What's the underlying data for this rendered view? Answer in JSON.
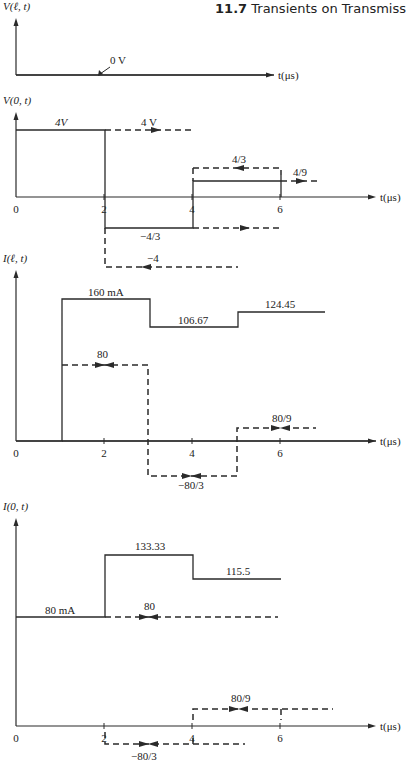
{
  "header": {
    "section_number": "11.7",
    "section_title": "Transients on Transmiss"
  },
  "colors": {
    "ink": "#2a2a2a",
    "background": "#ffffff"
  },
  "chart_data": [
    {
      "id": "v-load",
      "type": "line",
      "title": "",
      "ylabel": "V(ℓ, t)",
      "xlabel": "t(μs)",
      "origin": [
        16,
        75
      ],
      "px_per_us": 44,
      "axis_top": 18,
      "axis_right": 274,
      "ticks": [],
      "solid": [
        [
          [
            16,
            75
          ],
          [
            274,
            75
          ]
        ]
      ],
      "dashed": [],
      "arrows": [],
      "labels": [
        {
          "text": "0 V",
          "x": 110,
          "y": 64
        }
      ],
      "pointer": {
        "from": [
          110,
          67
        ],
        "to": [
          98,
          76
        ]
      }
    },
    {
      "id": "v-source",
      "type": "line",
      "ylabel": "V(0, t)",
      "xlabel": "t(μs)",
      "origin": [
        16,
        197
      ],
      "px_per_us": 44,
      "axis_top": 112,
      "axis_right": 376,
      "ticks": [
        {
          "t": 0,
          "label": "0"
        },
        {
          "t": 2,
          "label": "2"
        },
        {
          "t": 4,
          "label": "4"
        },
        {
          "t": 6,
          "label": "6"
        }
      ],
      "steps": [
        {
          "t_start": 0,
          "t_end": 2,
          "value": "4V"
        },
        {
          "t_start": 2,
          "t_end": 4,
          "value": "-4/3"
        },
        {
          "t_start": 4,
          "t_end": 6,
          "value": "4/9"
        }
      ],
      "solid": [
        [
          [
            16,
            130
          ],
          [
            105,
            130
          ],
          [
            105,
            228
          ],
          [
            193,
            228
          ],
          [
            193,
            181
          ],
          [
            281,
            181
          ]
        ],
        [
          [
            281,
            175
          ],
          [
            281,
            197
          ]
        ]
      ],
      "dashed": [
        [
          [
            105,
            130
          ],
          [
            192,
            130
          ]
        ],
        [
          [
            193,
            168
          ],
          [
            281,
            168
          ],
          [
            281,
            175
          ]
        ],
        [
          [
            193,
            168
          ],
          [
            193,
            181
          ]
        ],
        [
          [
            193,
            228
          ],
          [
            281,
            228
          ]
        ],
        [
          [
            281,
            181
          ],
          [
            318,
            181
          ]
        ],
        [
          [
            105,
            228
          ],
          [
            105,
            267
          ],
          [
            238,
            267
          ]
        ]
      ],
      "arrows": [
        {
          "x": 155,
          "y": 130,
          "dir": "right"
        },
        {
          "x": 240,
          "y": 168,
          "dir": "left"
        },
        {
          "x": 300,
          "y": 181,
          "dir": "right"
        },
        {
          "x": 244,
          "y": 228,
          "dir": "right"
        },
        {
          "x": 147,
          "y": 267,
          "dir": "left"
        }
      ],
      "labels": [
        {
          "text": "4V",
          "x": 55,
          "y": 126,
          "italic": true
        },
        {
          "text": "4 V",
          "x": 141,
          "y": 126
        },
        {
          "text": "4/3",
          "x": 232,
          "y": 163
        },
        {
          "text": "4/9",
          "x": 293,
          "y": 176
        },
        {
          "text": "−4/3",
          "x": 140,
          "y": 240
        },
        {
          "text": "−4",
          "x": 147,
          "y": 262
        }
      ]
    },
    {
      "id": "i-load",
      "type": "line",
      "ylabel": "I(ℓ, t)",
      "xlabel": "t(μs)",
      "origin": [
        16,
        441
      ],
      "px_per_us": 44,
      "axis_top": 270,
      "axis_right": 376,
      "ticks": [
        {
          "t": 0,
          "label": "0"
        },
        {
          "t": 2,
          "label": "2"
        },
        {
          "t": 4,
          "label": "4"
        },
        {
          "t": 6,
          "label": "6"
        }
      ],
      "steps": [
        {
          "t_start": 1,
          "t_end": 3,
          "value": "160 mA"
        },
        {
          "t_start": 3,
          "t_end": 5,
          "value": "106.67"
        },
        {
          "t_start": 5,
          "t_end": 7,
          "value": "124.45"
        }
      ],
      "solid": [
        [
          [
            16,
            441
          ],
          [
            62,
            441
          ],
          [
            62,
            299
          ],
          [
            150,
            299
          ],
          [
            150,
            327
          ],
          [
            238,
            327
          ],
          [
            238,
            312
          ],
          [
            325,
            312
          ]
        ],
        [
          [
            62,
            441
          ],
          [
            376,
            441
          ]
        ]
      ],
      "dashed": [
        [
          [
            62,
            365
          ],
          [
            148,
            365
          ],
          [
            148,
            476
          ],
          [
            237,
            476
          ],
          [
            237,
            428
          ],
          [
            316,
            428
          ]
        ]
      ],
      "arrows": [
        {
          "x": 99,
          "y": 365,
          "dir": "right"
        },
        {
          "x": 110,
          "y": 365,
          "dir": "left"
        },
        {
          "x": 186,
          "y": 476,
          "dir": "right"
        },
        {
          "x": 197,
          "y": 476,
          "dir": "left"
        },
        {
          "x": 275,
          "y": 428,
          "dir": "right"
        },
        {
          "x": 286,
          "y": 428,
          "dir": "left"
        }
      ],
      "labels": [
        {
          "text": "160 mA",
          "x": 88,
          "y": 296
        },
        {
          "text": "106.67",
          "x": 178,
          "y": 324
        },
        {
          "text": "124.45",
          "x": 265,
          "y": 308
        },
        {
          "text": "80",
          "x": 97,
          "y": 358
        },
        {
          "text": "80/9",
          "x": 272,
          "y": 422
        },
        {
          "text": "−80/3",
          "x": 178,
          "y": 489
        }
      ]
    },
    {
      "id": "i-source",
      "type": "line",
      "ylabel": "I(0, t)",
      "xlabel": "t(μs)",
      "origin": [
        16,
        726
      ],
      "px_per_us": 44,
      "axis_top": 518,
      "axis_right": 376,
      "ticks": [
        {
          "t": 0,
          "label": "0"
        },
        {
          "t": 2,
          "label": "2"
        },
        {
          "t": 4,
          "label": "4"
        },
        {
          "t": 6,
          "label": "6"
        }
      ],
      "steps": [
        {
          "t_start": 0,
          "t_end": 2,
          "value": "80 mA"
        },
        {
          "t_start": 2,
          "t_end": 4,
          "value": "133.33"
        },
        {
          "t_start": 4,
          "t_end": 6,
          "value": "115.5"
        }
      ],
      "solid": [
        [
          [
            16,
            617
          ],
          [
            105,
            617
          ],
          [
            105,
            555
          ],
          [
            193,
            555
          ],
          [
            193,
            579
          ],
          [
            281,
            579
          ]
        ]
      ],
      "dashed": [
        [
          [
            105,
            617
          ],
          [
            278,
            617
          ]
        ],
        [
          [
            193,
            720
          ],
          [
            193,
            709
          ],
          [
            333,
            709
          ]
        ],
        [
          [
            281,
            709
          ],
          [
            281,
            720
          ]
        ],
        [
          [
            105,
            732
          ],
          [
            105,
            744
          ],
          [
            245,
            744
          ]
        ],
        [
          [
            193,
            738
          ],
          [
            193,
            744
          ]
        ]
      ],
      "arrows": [
        {
          "x": 143,
          "y": 617,
          "dir": "right"
        },
        {
          "x": 154,
          "y": 617,
          "dir": "left"
        },
        {
          "x": 233,
          "y": 709,
          "dir": "right"
        },
        {
          "x": 244,
          "y": 709,
          "dir": "left"
        },
        {
          "x": 143,
          "y": 744,
          "dir": "right"
        },
        {
          "x": 154,
          "y": 744,
          "dir": "left"
        }
      ],
      "labels": [
        {
          "text": "133.33",
          "x": 135,
          "y": 550
        },
        {
          "text": "115.5",
          "x": 226,
          "y": 575
        },
        {
          "text": "80 mA",
          "x": 45,
          "y": 614
        },
        {
          "text": "80",
          "x": 144,
          "y": 610
        },
        {
          "text": "80/9",
          "x": 231,
          "y": 702
        },
        {
          "text": "−80/3",
          "x": 131,
          "y": 760
        }
      ]
    }
  ]
}
